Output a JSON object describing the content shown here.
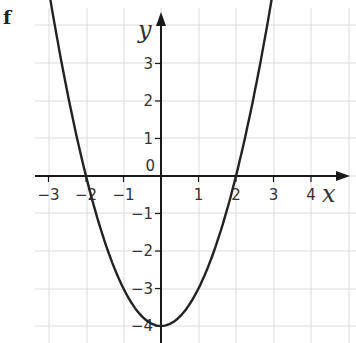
{
  "figure_label": "f",
  "chart_data": {
    "type": "line",
    "title": "",
    "function": "y = x^2 - 4",
    "xlabel": "x",
    "ylabel": "y",
    "xlim": [
      -3.3,
      5.0
    ],
    "ylim": [
      -4.5,
      4.2
    ],
    "grid": true,
    "legend": null,
    "x_ticks": [
      -3,
      -2,
      -1,
      1,
      2,
      3,
      4
    ],
    "x_tick_labels": [
      "−3",
      "−2",
      "−1",
      "1",
      "2",
      "3",
      "4"
    ],
    "y_ticks": [
      3,
      2,
      1,
      -1,
      -2,
      -3,
      -4
    ],
    "y_tick_labels": [
      "3",
      "2",
      "1",
      "−1",
      "−2",
      "−3",
      "−4"
    ],
    "origin_label": "0",
    "series": [
      {
        "name": "y = x^2 - 4",
        "x": [
          -3,
          -2.5,
          -2,
          -1.5,
          -1,
          -0.5,
          0,
          0.5,
          1,
          1.5,
          2,
          2.5,
          3
        ],
        "y": [
          5,
          2.25,
          0,
          -1.75,
          -3,
          -3.75,
          -4,
          -3.75,
          -3,
          -1.75,
          0,
          2.25,
          5
        ]
      }
    ],
    "key_points": {
      "x_intercepts": [
        [
          -2,
          0
        ],
        [
          2,
          0
        ]
      ],
      "vertex": [
        0,
        -4
      ]
    }
  },
  "layout": {
    "origin_px": [
      161,
      176
    ],
    "unit_px": 37.5,
    "grid_x_px": [
      49,
      87,
      124,
      161,
      199,
      236,
      274,
      311,
      349
    ],
    "grid_y_px": [
      25,
      63,
      101,
      138,
      176,
      213,
      251,
      289,
      326
    ],
    "curve_color": "#222222",
    "grid_color": "#dcdcdc"
  }
}
